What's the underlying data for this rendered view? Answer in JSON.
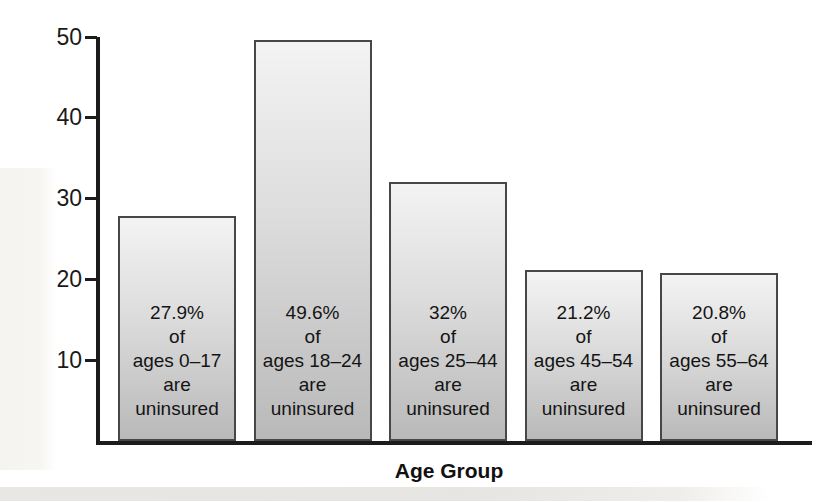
{
  "chart_data": {
    "type": "bar",
    "title": "",
    "xlabel": "Age Group",
    "ylabel": "",
    "ylim": [
      0,
      50
    ],
    "yticks": [
      10,
      20,
      30,
      40,
      50
    ],
    "grid": false,
    "legend": null,
    "categories": [
      "ages 0–17",
      "ages 18–24",
      "ages 25–44",
      "ages 45–54",
      "ages 55–64"
    ],
    "values": [
      27.9,
      49.6,
      32,
      21.2,
      20.8
    ],
    "bar_labels": [
      [
        "27.9%",
        "of",
        "ages 0–17",
        "are",
        "uninsured"
      ],
      [
        "49.6%",
        "of",
        "ages 18–24",
        "are",
        "uninsured"
      ],
      [
        "32%",
        "of",
        "ages 25–44",
        "are",
        "uninsured"
      ],
      [
        "21.2%",
        "of",
        "ages 45–54",
        "are",
        "uninsured"
      ],
      [
        "20.8%",
        "of",
        "ages 55–64",
        "are",
        "uninsured"
      ]
    ],
    "colors": {
      "bar_gradient_top": "#f3f3f3",
      "bar_gradient_bottom": "#b9b9b9",
      "bar_border": "#474747",
      "axis": "#1c1c1c",
      "text": "#141414"
    }
  }
}
